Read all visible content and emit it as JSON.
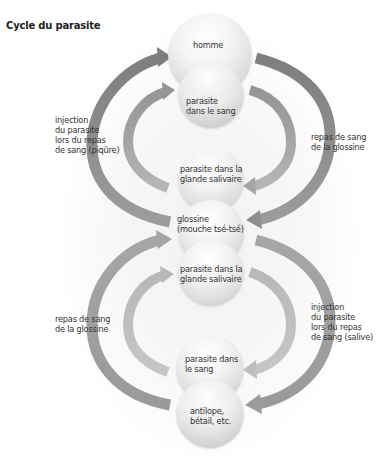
{
  "title": "Cycle du parasite",
  "colors": {
    "arrow_top_outer": "#8a8a8a",
    "arrow_top_inner": "#9e9e9e",
    "arrow_bottom_outer": "#ababab",
    "arrow_bottom_inner": "#bcbcbc",
    "sphere_light": "#f4f4f4",
    "sphere_dark": "#bdbdbd"
  },
  "spheres": {
    "homme": {
      "lines": [
        "homme"
      ]
    },
    "parasite_sang_top": {
      "lines": [
        "parasite",
        "dans le sang"
      ]
    },
    "parasite_glande_top": {
      "lines": [
        "parasite dans la",
        "glande salivaire"
      ]
    },
    "glossine": {
      "lines": [
        "glossine",
        "(mouche tsé-tsé)"
      ]
    },
    "parasite_glande_bottom": {
      "lines": [
        "parasite dans la",
        "glande salivaire"
      ]
    },
    "parasite_sang_bottom": {
      "lines": [
        "parasite dans",
        "le sang"
      ]
    },
    "antilope": {
      "lines": [
        "antilope,",
        "bétail, etc."
      ]
    }
  },
  "side_labels": {
    "top_left": {
      "lines": [
        "injection",
        "du parasite",
        "lors du repas",
        "de sang (piqûre)"
      ]
    },
    "top_right": {
      "lines": [
        "repas de sang",
        "de la glossine"
      ]
    },
    "bottom_left": {
      "lines": [
        "repas de sang",
        "de la glossine"
      ]
    },
    "bottom_right": {
      "lines": [
        "injection",
        "du parasite",
        "lors du repas",
        "de sang (salive)"
      ]
    }
  }
}
